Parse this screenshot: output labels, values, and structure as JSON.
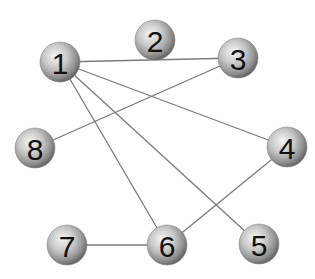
{
  "diagram": {
    "type": "undirected-graph",
    "colors": {
      "background": "#ffffff",
      "edge": "#7a7a7a",
      "node_highlight": "#f4f4f4",
      "node_mid": "#b8b8b8",
      "node_shadow": "#5e5e5e",
      "label": "#111111"
    },
    "node_radius": 20,
    "nodes": [
      {
        "id": "1",
        "label": "1",
        "x": 60,
        "y": 62
      },
      {
        "id": "2",
        "label": "2",
        "x": 155,
        "y": 40
      },
      {
        "id": "3",
        "label": "3",
        "x": 238,
        "y": 58
      },
      {
        "id": "4",
        "label": "4",
        "x": 287,
        "y": 147
      },
      {
        "id": "5",
        "label": "5",
        "x": 259,
        "y": 244
      },
      {
        "id": "6",
        "label": "6",
        "x": 167,
        "y": 245
      },
      {
        "id": "7",
        "label": "7",
        "x": 67,
        "y": 245
      },
      {
        "id": "8",
        "label": "8",
        "x": 35,
        "y": 148
      }
    ],
    "edges": [
      {
        "from": "1",
        "to": "3"
      },
      {
        "from": "1",
        "to": "4"
      },
      {
        "from": "1",
        "to": "5"
      },
      {
        "from": "1",
        "to": "6"
      },
      {
        "from": "3",
        "to": "8"
      },
      {
        "from": "4",
        "to": "6"
      },
      {
        "from": "6",
        "to": "7"
      }
    ]
  }
}
